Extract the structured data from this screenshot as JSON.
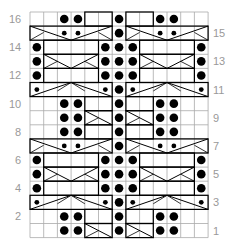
{
  "chart": {
    "columns": 13,
    "rows": 16,
    "grid": {
      "left": 30,
      "top": 12,
      "cell_w": 13.7,
      "cell_h": 14.1
    },
    "colors": {
      "grid": "#aaaaaa",
      "ink": "#000000",
      "label": "#999999"
    },
    "row_labels_left": [
      "16",
      "14",
      "12",
      "10",
      "8",
      "6",
      "4",
      "2"
    ],
    "row_labels_right": [
      "15",
      "13",
      "11",
      "9",
      "7",
      "5",
      "3",
      "1"
    ],
    "row_patterns": {
      "16": {
        "big": [
          2,
          3,
          6,
          9,
          10
        ],
        "small": [],
        "cable": "none"
      },
      "15": {
        "big": [
          6
        ],
        "small": [
          2,
          3,
          9,
          10
        ],
        "cable": "v"
      },
      "14": {
        "big": [
          0,
          5,
          6,
          7,
          12
        ],
        "small": [],
        "cable": "none"
      },
      "13": {
        "big": [
          0,
          5,
          6,
          7,
          12
        ],
        "small": [],
        "cable": "x4"
      },
      "12": {
        "big": [
          0,
          5,
          6,
          7,
          12
        ],
        "small": [],
        "cable": "none"
      },
      "11": {
        "big": [
          6
        ],
        "small": [
          0,
          5,
          7,
          12
        ],
        "cable": "inv-v"
      },
      "10": {
        "big": [
          2,
          3,
          6,
          9,
          10
        ],
        "small": [],
        "cable": "none"
      },
      "9": {
        "big": [
          2,
          3,
          6,
          9,
          10
        ],
        "small": [],
        "cable": "x2"
      },
      "8": {
        "big": [
          2,
          3,
          6,
          9,
          10
        ],
        "small": [],
        "cable": "none"
      },
      "7": {
        "big": [
          6
        ],
        "small": [
          2,
          3,
          9,
          10
        ],
        "cable": "v"
      },
      "6": {
        "big": [
          0,
          5,
          6,
          7,
          12
        ],
        "small": [],
        "cable": "none"
      },
      "5": {
        "big": [
          0,
          5,
          6,
          7,
          12
        ],
        "small": [],
        "cable": "x4"
      },
      "4": {
        "big": [
          0,
          5,
          6,
          7,
          12
        ],
        "small": [],
        "cable": "none"
      },
      "3": {
        "big": [
          6
        ],
        "small": [
          0,
          5,
          7,
          12
        ],
        "cable": "inv-v"
      },
      "2": {
        "big": [
          2,
          3,
          6,
          9,
          10
        ],
        "small": [],
        "cable": "none"
      },
      "1": {
        "big": [
          2,
          3,
          6,
          9,
          10
        ],
        "small": [],
        "cable": "x2"
      }
    }
  }
}
